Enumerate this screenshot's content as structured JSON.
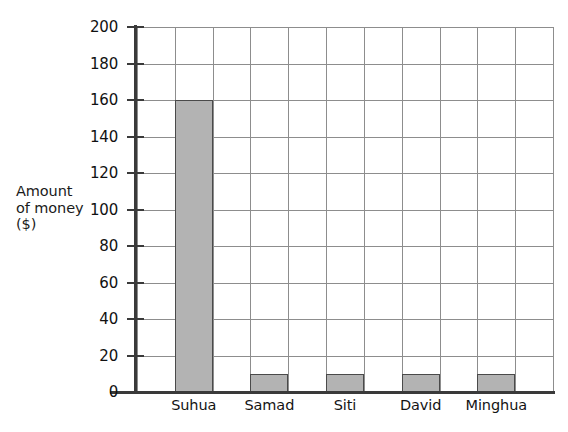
{
  "chart_data": {
    "type": "bar",
    "title": "",
    "xlabel": "",
    "ylabel": "Amount of money ($)",
    "ylabel_lines": [
      "Amount",
      "of money",
      "($)"
    ],
    "categories": [
      "Suhua",
      "Samad",
      "Siti",
      "David",
      "Minghua"
    ],
    "values": [
      160,
      10,
      10,
      10,
      10
    ],
    "ylim": [
      0,
      200
    ],
    "ytick_step": 20,
    "yticks": [
      0,
      20,
      40,
      60,
      80,
      100,
      120,
      140,
      160,
      180,
      200
    ],
    "ytick_labels": [
      "0",
      "20",
      "40",
      "60",
      "80",
      "100",
      "120",
      "140",
      "160",
      "180",
      "200"
    ],
    "grid": true,
    "grid_columns": 11,
    "grid_rows": 10,
    "legend": null,
    "legend_position": "none",
    "bar_fill_color": "#b3b3b3",
    "bar_border_color": "#4a4a4a",
    "axis_color": "#3a3a3a",
    "gridline_color": "#8d8d8d",
    "background_color": "#ffffff"
  },
  "bleed_text": {
    "line1": "a",
    "line2": "b",
    "line3": "c"
  }
}
